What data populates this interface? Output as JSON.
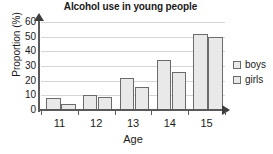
{
  "chart_data": {
    "type": "bar",
    "title": "Alcohol use in young people",
    "xlabel": "Age",
    "ylabel": "Proportion (%)",
    "categories": [
      "11",
      "12",
      "13",
      "14",
      "15"
    ],
    "series": [
      {
        "name": "boys",
        "values": [
          8,
          10,
          22,
          34,
          52
        ]
      },
      {
        "name": "girls",
        "values": [
          4,
          9,
          16,
          26,
          50
        ]
      }
    ],
    "ylim": [
      0,
      60
    ],
    "yticks": [
      0,
      10,
      20,
      30,
      40,
      50,
      60
    ],
    "ytick_labels": [
      "0",
      "10",
      "20",
      "30",
      "40",
      "50",
      "60"
    ],
    "grid": true,
    "grid_axis": "y",
    "legend": {
      "position": "right",
      "entries": [
        "boys",
        "girls"
      ]
    },
    "bar_fill_color": "#e9e9e9",
    "bar_border_color": "#6b6b6b",
    "axis_color": "#595959",
    "grid_color": "#d6d6d6",
    "text_color": "#1a1a1a"
  }
}
